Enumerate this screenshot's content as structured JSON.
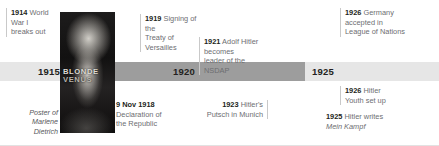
{
  "figure": {
    "name": "weimar-republic-timeline",
    "background": "#ffffff"
  },
  "axis": {
    "segments": [
      {
        "label": "",
        "shade": "light"
      },
      {
        "label": "1915",
        "shade": "light"
      },
      {
        "label": "",
        "shade": "dark"
      },
      {
        "label": "1920",
        "shade": "dark"
      },
      {
        "label": "",
        "shade": "dark"
      },
      {
        "label": "1925",
        "shade": "light"
      },
      {
        "label": "",
        "shade": "light"
      }
    ],
    "years": [
      "1915",
      "1920",
      "1925"
    ],
    "colors": {
      "dark": "#9d9d9d",
      "light": "#e6e6e6",
      "year_text": "#231f20"
    }
  },
  "events_above": [
    {
      "id": "ww1",
      "year": "1914",
      "text": " World War I breaks out",
      "lines": [
        "World War I",
        "breaks out"
      ]
    },
    {
      "id": "versailles",
      "year": "1919",
      "text": " Signing of the Treaty of Versailles",
      "lines": [
        "Signing of the",
        "Treaty of Versailles"
      ]
    },
    {
      "id": "nsdap-leader",
      "year": "1921",
      "text": " Adolf Hitler becomes leader of the NSDAP",
      "lines": [
        "Adolf Hitler becomes",
        "leader of the NSDAP"
      ]
    },
    {
      "id": "league-of-nations",
      "year": "1926",
      "text": " Germany accepted in League of Nations",
      "lines": [
        "Germany",
        "accepted in",
        "League of Nations"
      ]
    }
  ],
  "events_below": [
    {
      "id": "declaration-republic",
      "year": "9 Nov 1918",
      "text": " Declaration of the Republic",
      "lines": [
        "Declaration of",
        "the Republic"
      ]
    },
    {
      "id": "munich-putsch",
      "year": "1923",
      "text": " Hitler's Putsch in Munich",
      "lines": [
        "Hitler's",
        "Putsch in Munich"
      ]
    },
    {
      "id": "hitler-youth",
      "year": "1926",
      "text": " Hitler Youth set up",
      "lines": [
        "Hitler",
        "Youth set up"
      ]
    },
    {
      "id": "mein-kampf",
      "year": "1925",
      "text_plain": " Hitler writes ",
      "text_italic": "Mein Kampf",
      "lines": [
        "Hitler writes",
        "Mein Kampf"
      ]
    }
  ],
  "photo": {
    "caption_line1": "Poster of Marlene",
    "caption_line2": "Dietrich",
    "poster_title_line1": "BLONDE",
    "poster_title_line2": "VENUS"
  },
  "labels": {
    "e1914_year": "1914",
    "e1914_l1": " World War I",
    "e1914_l2": "breaks out",
    "e1919_year": "1919",
    "e1919_l1": " Signing of the",
    "e1919_l2": "Treaty of Versailles",
    "e1921_year": "1921",
    "e1921_l1": " Adolf Hitler becomes",
    "e1921_l2": "leader of the NSDAP",
    "e1926g_year": "1926",
    "e1926g_l1": " Germany",
    "e1926g_l2": "accepted in",
    "e1926g_l3": "League of Nations",
    "e1918_year": "9 Nov 1918",
    "e1918_l1": "Declaration of",
    "e1918_l2": "the Republic",
    "e1923_year": "1923",
    "e1923_l1": " Hitler's",
    "e1923_l2": "Putsch in Munich",
    "e1926y_year": "1926",
    "e1926y_l1": " Hitler",
    "e1926y_l2": "Youth set up",
    "e1925_year": "1925",
    "e1925_l1": " Hitler writes",
    "e1925_l2": "Mein Kampf",
    "year_1915": "1915",
    "year_1920": "1920",
    "year_1925": "1925",
    "caption_l1": "Poster of Marlene",
    "caption_l2": "Dietrich",
    "poster_l1": "BLONDE",
    "poster_l2": "VENUS"
  }
}
